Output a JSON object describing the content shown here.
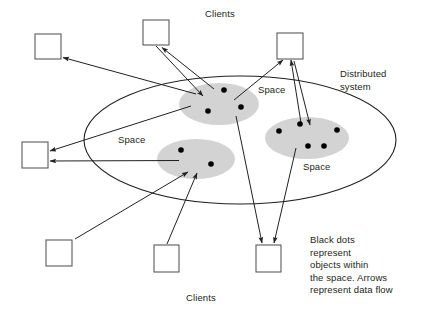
{
  "figure": {
    "labels": {
      "clients_top": "Clients",
      "clients_bottom": "Clients",
      "space_top": "Space",
      "space_left": "Space",
      "space_right": "Space",
      "distributed_system": "Distributed\nsystem",
      "caption": "Black dots\nrepresent\nobjects within\nthe space. Arrows\nrepresent data flow"
    },
    "colors": {
      "background": "#ffffff",
      "stroke": "#231f20",
      "text": "#231f20",
      "space_fill": "#d4d4d4",
      "dot_fill": "#000000",
      "box_fill": "#ffffff",
      "box_stroke": "#58595b"
    },
    "outer_ellipse": {
      "name": "distributed-system",
      "cx": 240,
      "cy": 140,
      "rx": 156,
      "ry": 64
    },
    "spaces": [
      {
        "name": "space-top",
        "label": "Space",
        "cx": 219,
        "cy": 104,
        "rx": 40,
        "ry": 21,
        "dots": [
          [
            224,
            90
          ],
          [
            208,
            111
          ],
          [
            241,
            107
          ]
        ]
      },
      {
        "name": "space-left",
        "label": "Space",
        "cx": 196,
        "cy": 159,
        "rx": 39,
        "ry": 20,
        "dots": [
          [
            181,
            150
          ],
          [
            211,
            164
          ]
        ]
      },
      {
        "name": "space-right",
        "label": "Space",
        "cx": 307,
        "cy": 138,
        "rx": 42,
        "ry": 21,
        "dots": [
          [
            279,
            131
          ],
          [
            300,
            124
          ],
          [
            337,
            130
          ],
          [
            308,
            146
          ],
          [
            324,
            146
          ]
        ]
      }
    ],
    "clients": [
      {
        "name": "client-top-left",
        "x": 35,
        "y": 34,
        "w": 26,
        "h": 25
      },
      {
        "name": "client-top-middle",
        "x": 143,
        "y": 20,
        "w": 26,
        "h": 25
      },
      {
        "name": "client-top-right",
        "x": 277,
        "y": 33,
        "w": 26,
        "h": 26
      },
      {
        "name": "client-middle-left",
        "x": 22,
        "y": 142,
        "w": 26,
        "h": 26
      },
      {
        "name": "client-bottom-left",
        "x": 46,
        "y": 240,
        "w": 26,
        "h": 26
      },
      {
        "name": "client-bottom-mid",
        "x": 154,
        "y": 245,
        "w": 25,
        "h": 27
      },
      {
        "name": "client-bottom-right",
        "x": 256,
        "y": 245,
        "w": 25,
        "h": 27
      }
    ],
    "arrows": [
      {
        "name": "arrow-space-top-to-client-top-left",
        "from": [
          196,
          94
        ],
        "to": [
          62,
          57
        ]
      },
      {
        "name": "arrow-client-top-middle-to-space-top",
        "from": [
          157,
          46
        ],
        "to": [
          204,
          96
        ]
      },
      {
        "name": "arrow-space-top-to-client-top-middle",
        "from": [
          213,
          88
        ],
        "to": [
          161,
          47
        ]
      },
      {
        "name": "arrow-space-top-to-client-top-right",
        "from": [
          236,
          100
        ],
        "to": [
          283,
          60
        ]
      },
      {
        "name": "arrow-client-top-right-to-space-right",
        "from": [
          294,
          60
        ],
        "to": [
          311,
          127
        ]
      },
      {
        "name": "arrow-space-right-to-client-top-right",
        "from": [
          300,
          124
        ],
        "to": [
          290,
          60
        ]
      },
      {
        "name": "arrow-space-top-to-client-middle-left",
        "from": [
          190,
          106
        ],
        "to": [
          50,
          152
        ]
      },
      {
        "name": "arrow-space-left-to-client-middle-left",
        "from": [
          178,
          160
        ],
        "to": [
          50,
          161
        ]
      },
      {
        "name": "arrow-client-bottom-left-to-space-left",
        "from": [
          74,
          239
        ],
        "to": [
          188,
          172
        ]
      },
      {
        "name": "arrow-client-bottom-mid-to-space-left",
        "from": [
          166,
          244
        ],
        "to": [
          196,
          173
        ]
      },
      {
        "name": "arrow-space-top-to-client-bottom-right",
        "from": [
          236,
          116
        ],
        "to": [
          262,
          244
        ]
      },
      {
        "name": "arrow-space-right-to-client-bottom-right",
        "from": [
          295,
          148
        ],
        "to": [
          273,
          244
        ]
      }
    ]
  }
}
